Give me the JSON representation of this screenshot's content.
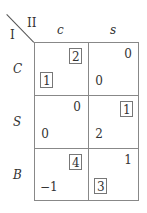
{
  "matrix": {
    "player_row": "I",
    "player_col": "II",
    "col_strategies": [
      "c",
      "s"
    ],
    "row_strategies": [
      "C",
      "S",
      "B"
    ],
    "cells": [
      [
        {
          "row_payoff": "1",
          "row_boxed": true,
          "col_payoff": "2",
          "col_boxed": true
        },
        {
          "row_payoff": "0",
          "row_boxed": false,
          "col_payoff": "0",
          "col_boxed": false
        }
      ],
      [
        {
          "row_payoff": "0",
          "row_boxed": false,
          "col_payoff": "0",
          "col_boxed": false
        },
        {
          "row_payoff": "2",
          "row_boxed": false,
          "col_payoff": "1",
          "col_boxed": true
        }
      ],
      [
        {
          "row_payoff": "−1",
          "row_boxed": false,
          "col_payoff": "4",
          "col_boxed": true
        },
        {
          "row_payoff": "3",
          "row_boxed": true,
          "col_payoff": "1",
          "col_boxed": false
        }
      ]
    ]
  },
  "colors": {
    "text": "#333333",
    "grid": "#888888",
    "box": "#777777"
  }
}
